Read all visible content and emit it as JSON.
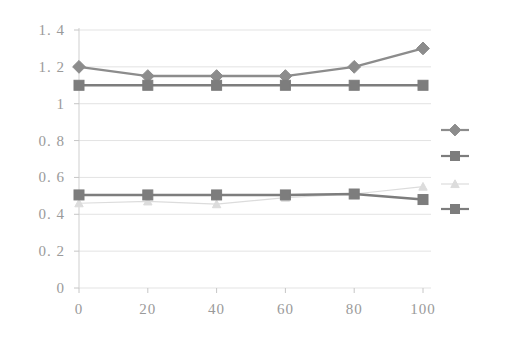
{
  "chart_data": {
    "type": "line",
    "title": "",
    "subtitle": "",
    "xlabel": "",
    "ylabel": "",
    "x": [
      0,
      20,
      40,
      60,
      80,
      100
    ],
    "xticklabels": [
      "0",
      "20",
      "40",
      "60",
      "80",
      "100"
    ],
    "yticklabels": [
      "0",
      "0. 2",
      "0. 4",
      "0. 6",
      "0. 8",
      "1",
      "1. 2",
      "1. 4"
    ],
    "yticks": [
      0,
      0.2,
      0.4,
      0.6,
      0.8,
      1.0,
      1.2,
      1.4
    ],
    "xlim": [
      0,
      100
    ],
    "ylim": [
      0,
      1.4
    ],
    "grid": "horizontal",
    "legend_position": "right",
    "series": [
      {
        "name": "series-1",
        "marker": "diamond",
        "color": "#8c8c8c",
        "values": [
          1.2,
          1.15,
          1.15,
          1.15,
          1.2,
          1.3
        ]
      },
      {
        "name": "series-2",
        "marker": "square",
        "color": "#7d7d7d",
        "values": [
          1.1,
          1.1,
          1.1,
          1.1,
          1.1,
          1.1
        ]
      },
      {
        "name": "series-3",
        "marker": "triangle",
        "color": "#dcdcdc",
        "values": [
          0.46,
          0.47,
          0.455,
          0.49,
          0.51,
          0.55
        ]
      },
      {
        "name": "series-4",
        "marker": "square",
        "color": "#7d7d7d",
        "values": [
          0.505,
          0.505,
          0.505,
          0.505,
          0.51,
          0.48
        ]
      }
    ],
    "legend_entries": [
      {
        "label": "",
        "marker": "diamond",
        "color": "#8c8c8c"
      },
      {
        "label": "",
        "marker": "square",
        "color": "#7d7d7d"
      },
      {
        "label": "",
        "marker": "triangle",
        "color": "#dcdcdc"
      },
      {
        "label": "",
        "marker": "square",
        "color": "#7d7d7d"
      }
    ]
  },
  "axis": {
    "y_labels": [
      "1. 4",
      "1. 2",
      "1",
      "0. 8",
      "0. 6",
      "0. 4",
      "0. 2",
      "0"
    ],
    "x_labels": [
      "0",
      "20",
      "40",
      "60",
      "80",
      "100"
    ]
  },
  "colors": {
    "background": "#ffffff",
    "grid": "#e3e3e3",
    "axis": "#cfcfcf",
    "tick_text": "#9a9a9a",
    "series_dark": "#7d7d7d",
    "series_mid": "#8c8c8c",
    "series_faint": "#dcdcdc"
  }
}
